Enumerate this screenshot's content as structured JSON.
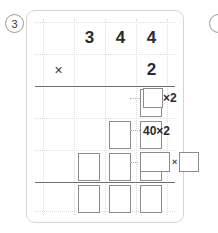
{
  "problem": {
    "number": "3",
    "multiplicand": [
      "3",
      "4",
      "4"
    ],
    "operator": "×",
    "multiplier": "2"
  },
  "grid": {
    "columns": 4,
    "rows": 6
  },
  "annotations": [
    {
      "id": "ones",
      "type": "box-times-number",
      "box": "",
      "times": "×2"
    },
    {
      "id": "tens",
      "type": "text",
      "label": "40×2"
    },
    {
      "id": "hundreds",
      "type": "box-times-box",
      "box_left": "",
      "times": "×",
      "box_right": ""
    }
  ],
  "answer_boxes": {
    "row_ones": 1,
    "row_tens": 2,
    "row_hundreds": 3,
    "row_total": 3
  }
}
